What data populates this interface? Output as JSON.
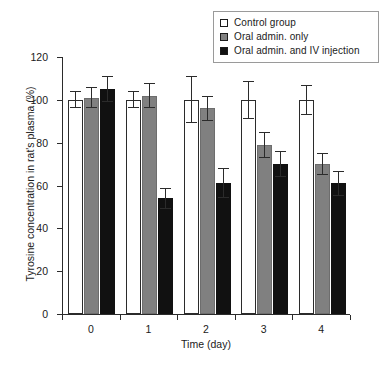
{
  "chart_data": {
    "type": "bar",
    "title": "",
    "xlabel": "Time (day)",
    "ylabel": "Tyrosine concentration in rat's plasma (%)",
    "categories": [
      "0",
      "1",
      "2",
      "3",
      "4"
    ],
    "ylim": [
      0,
      120
    ],
    "yticks": [
      "0",
      "20",
      "40",
      "60",
      "80",
      "100",
      "120"
    ],
    "grid": false,
    "legend_position": "top-right",
    "series": [
      {
        "name": "Control group",
        "color": "#ffffff",
        "edge_color": "#2b2b2b",
        "values": [
          100,
          100,
          100,
          100,
          100
        ],
        "errors": [
          4,
          4,
          11,
          9,
          7
        ]
      },
      {
        "name": "Oral admin. only",
        "color": "#808080",
        "edge_color": "#6d6d6d",
        "values": [
          101,
          102,
          96,
          79,
          70
        ],
        "errors": [
          5,
          6,
          6,
          6,
          5
        ]
      },
      {
        "name": "Oral admin. and IV injection",
        "color": "#111111",
        "edge_color": "#111111",
        "values": [
          105,
          54,
          61,
          70,
          61
        ],
        "errors": [
          6,
          5,
          7,
          6,
          6
        ]
      }
    ]
  },
  "legend": {
    "items": [
      {
        "label": "Control group"
      },
      {
        "label": "Oral admin. only"
      },
      {
        "label": "Oral admin. and IV injection"
      }
    ]
  },
  "axes": {
    "y_title": "Tyrosine concentration in rat's plasma (%)",
    "x_title": "Time (day)",
    "y_ticks": [
      "120",
      "100",
      "80",
      "60",
      "40",
      "20",
      "0"
    ],
    "x_ticks": [
      "0",
      "1",
      "2",
      "3",
      "4"
    ]
  }
}
